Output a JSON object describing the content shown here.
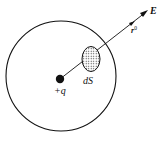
{
  "diagram": {
    "charge_label": "+q",
    "surface_element_label": "dS",
    "unit_vector_label": "r",
    "unit_vector_superscript": "0",
    "field_label": "E",
    "colors": {
      "ink": "#111111",
      "background": "#ffffff"
    }
  }
}
